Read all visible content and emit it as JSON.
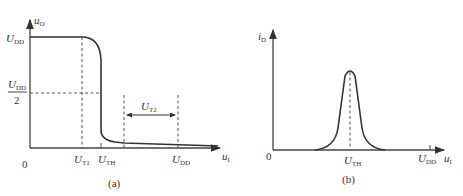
{
  "panel_a": {
    "caption": "(a)",
    "y_axis": {
      "var": "u",
      "sub": "O"
    },
    "x_axis": {
      "var": "u",
      "sub": "I"
    },
    "origin": "0",
    "y_ticks": [
      {
        "main": "U",
        "sub": "DD"
      },
      {
        "main": "U",
        "sub": "DD",
        "denominator": "2"
      }
    ],
    "x_ticks": [
      {
        "main": "U",
        "sub": "T1"
      },
      {
        "main": "U",
        "sub": "TH"
      },
      {
        "main": "U",
        "sub": "DD"
      }
    ],
    "span_label": {
      "main": "U",
      "sub": "T2"
    }
  },
  "panel_b": {
    "caption": "(b)",
    "y_axis": {
      "var": "i",
      "sub": "D"
    },
    "x_axis": {
      "var": "u",
      "sub": "I"
    },
    "origin": "0",
    "x_ticks": [
      {
        "main": "U",
        "sub": "TH"
      },
      {
        "main": "U",
        "sub": "DD"
      }
    ]
  }
}
